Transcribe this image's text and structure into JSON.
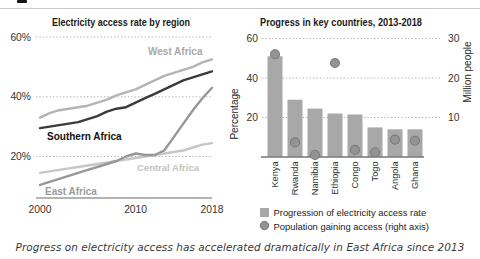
{
  "caption": "Progress on electricity access has accelerated dramatically in East Africa since 2013",
  "chart_data": [
    {
      "type": "line",
      "title": "Electricity access rate by region",
      "x_ticks": [
        "2000",
        "2010",
        "2018"
      ],
      "x_range": [
        2000,
        2018
      ],
      "years": [
        2000,
        2001,
        2002,
        2003,
        2004,
        2005,
        2006,
        2007,
        2008,
        2009,
        2010,
        2011,
        2012,
        2013,
        2014,
        2015,
        2016,
        2017,
        2018
      ],
      "y_ticks": [
        "20%",
        "40%",
        "60%"
      ],
      "ylim": [
        6,
        63
      ],
      "grid": "dotted-horizontal",
      "unit": "percent",
      "series": [
        {
          "name": "West Africa",
          "color": "#b4b4b4",
          "label_color": "#a9a9a9",
          "values": [
            33,
            34.5,
            35.5,
            36,
            36.5,
            37,
            38,
            39,
            40.5,
            41.5,
            42.5,
            44,
            45.5,
            47,
            48,
            49,
            50,
            51.5,
            52.5
          ]
        },
        {
          "name": "Southern Africa",
          "color": "#3b3b3b",
          "label_color": "#111111",
          "values": [
            29.5,
            30,
            30.5,
            31,
            31.5,
            32.5,
            33.5,
            35,
            36,
            36.5,
            38,
            39.5,
            41,
            42.5,
            44,
            45.5,
            46.5,
            47.5,
            48.5
          ]
        },
        {
          "name": "Central Africa",
          "color": "#c6c6c6",
          "label_color": "#c2c2c2",
          "values": [
            14.5,
            15,
            15.5,
            16,
            16.5,
            17,
            17.5,
            18,
            18.5,
            19,
            19.5,
            20,
            20.5,
            21,
            21.5,
            22,
            23,
            24,
            24.5
          ]
        },
        {
          "name": "East Africa",
          "color": "#979797",
          "label_color": "#9b9b9b",
          "values": [
            10.5,
            11.5,
            12.5,
            13.5,
            14.5,
            15.5,
            16.5,
            17.5,
            18.5,
            20,
            21,
            20.5,
            20.5,
            22,
            26.5,
            31,
            35.5,
            39.5,
            43
          ]
        }
      ]
    },
    {
      "type": "bar",
      "title": "Progress in key countries, 2013-2018",
      "categories": [
        "Kenya",
        "Rwanda",
        "Namibia",
        "Ethiopia",
        "Congo",
        "Togo",
        "Angola",
        "Ghana"
      ],
      "left_axis": {
        "label": "Percentage",
        "ticks": [
          20,
          40,
          60
        ],
        "range": [
          0,
          63
        ]
      },
      "right_axis": {
        "label": "Million people",
        "ticks": [
          10,
          20,
          30
        ],
        "range": [
          0,
          31.5
        ]
      },
      "grid": "dotted-horizontal",
      "legend_position": "bottom",
      "series": [
        {
          "name": "Progression of electricity access rate",
          "type": "bar",
          "axis": "left",
          "color": "#a8a8a8",
          "values": [
            51,
            29,
            24.5,
            22,
            21.5,
            15,
            14,
            14
          ]
        },
        {
          "name": "Population gaining access (right axis)",
          "type": "scatter",
          "axis": "right",
          "color": "#939393",
          "values": [
            26,
            3.7,
            0.5,
            23.8,
            1.8,
            1.2,
            4.4,
            4.1
          ]
        }
      ]
    }
  ]
}
